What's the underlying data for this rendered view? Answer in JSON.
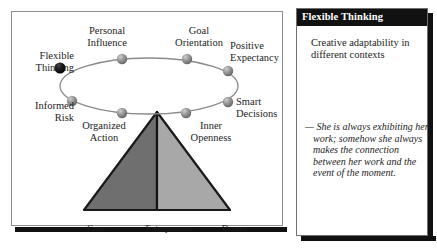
{
  "diagram": {
    "nodes": [
      {
        "id": "flexible-thinking",
        "label": "Flexible\nThinking",
        "highlighted": true,
        "cx": 48,
        "cy": 56
      },
      {
        "id": "personal-influence",
        "label": "Personal\nInfluence",
        "highlighted": false,
        "cx": 120,
        "cy": 47
      },
      {
        "id": "goal-orientation",
        "label": "Goal\nOrientation",
        "highlighted": false,
        "cx": 185,
        "cy": 47
      },
      {
        "id": "positive-expectancy",
        "label": "Positive\nExpectancy",
        "highlighted": false,
        "cx": 226,
        "cy": 59
      },
      {
        "id": "smart-decisions",
        "label": "Smart\nDecisions",
        "highlighted": false,
        "cx": 226,
        "cy": 90
      },
      {
        "id": "inner-openness",
        "label": "Inner\nOpenness",
        "highlighted": false,
        "cx": 182,
        "cy": 101
      },
      {
        "id": "organized-action",
        "label": "Organized\nAction",
        "highlighted": false,
        "cx": 118,
        "cy": 101
      },
      {
        "id": "informed-risk",
        "label": "Informed\nRisk",
        "highlighted": false,
        "cx": 62,
        "cy": 89
      }
    ],
    "ellipse": {
      "cx": 137,
      "cy": 74,
      "rx": 89,
      "ry": 28
    },
    "triangle": {
      "apex_label": "",
      "segments": [
        {
          "id": "core-half",
          "label": "Core",
          "fill": "#6f6f6f"
        },
        {
          "id": "dream-half",
          "label": "Dream",
          "fill": "#a8a8a8"
        }
      ],
      "base_labels": [
        "Core",
        "Entrepreneur",
        "Dream"
      ]
    },
    "colors": {
      "node_fill": "#8f8f8f",
      "node_highlight": "#121212",
      "ellipse_stroke": "#8a8a8a",
      "triangle_left": "#6f6f6f",
      "triangle_right": "#a8a8a8",
      "triangle_outline": "#1a1a1a"
    }
  },
  "card": {
    "title": "Flexible Thinking",
    "description": "Creative adaptability\nin different contexts",
    "quote": "— She is always exhibiting her work; somehow she always makes the connection between her work and the event of the moment.",
    "header_background": "#111111",
    "header_text_color": "#ffffff"
  }
}
